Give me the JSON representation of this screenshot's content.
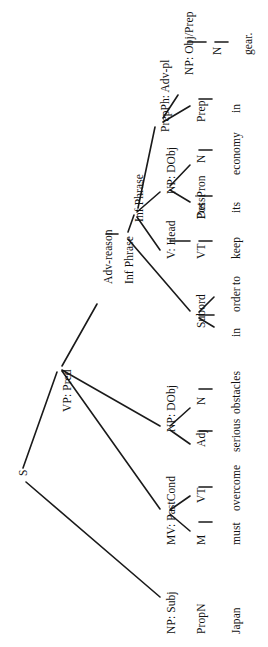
{
  "diagram": {
    "sentence": "Japan must overcome serious obstacles in order to keep its economy in gear.",
    "orientation": "rotated-90-ccw",
    "root": "S",
    "nodes": [
      {
        "id": "s",
        "label": "S",
        "kind": "node",
        "x": 18,
        "y": 476
      },
      {
        "id": "np_subj",
        "label": "NP: Subj",
        "kind": "node",
        "x": 166,
        "y": 634
      },
      {
        "id": "propn",
        "label": "PropN",
        "kind": "node",
        "x": 196,
        "y": 634
      },
      {
        "id": "japan",
        "label": "Japan",
        "kind": "leaf",
        "x": 231,
        "y": 634
      },
      {
        "id": "vp_pred",
        "label": "VP: Pred",
        "kind": "node",
        "x": 62,
        "y": 412
      },
      {
        "id": "mv_pastcond",
        "label": "MV: PastCond",
        "kind": "node",
        "x": 166,
        "y": 545
      },
      {
        "id": "m",
        "label": "M",
        "kind": "node",
        "x": 196,
        "y": 545
      },
      {
        "id": "must",
        "label": "must",
        "kind": "leaf",
        "x": 231,
        "y": 545
      },
      {
        "id": "vt1",
        "label": "VT",
        "kind": "node",
        "x": 196,
        "y": 503
      },
      {
        "id": "overcome",
        "label": "overcome",
        "kind": "leaf",
        "x": 231,
        "y": 511
      },
      {
        "id": "np_dobj1",
        "label": "NP: DObj",
        "kind": "node",
        "x": 166,
        "y": 432
      },
      {
        "id": "adj",
        "label": "Adj",
        "kind": "node",
        "x": 196,
        "y": 447
      },
      {
        "id": "serious",
        "label": "serious",
        "kind": "leaf",
        "x": 231,
        "y": 452
      },
      {
        "id": "n1",
        "label": "N",
        "kind": "node",
        "x": 196,
        "y": 405
      },
      {
        "id": "obstacles",
        "label": "obstacles",
        "kind": "leaf",
        "x": 231,
        "y": 414
      },
      {
        "id": "adv_reason",
        "label": "Adv-reason",
        "kind": "node",
        "x": 103,
        "y": 284
      },
      {
        "id": "inf_phrase1",
        "label": "Inf Phrase",
        "kind": "node",
        "x": 124,
        "y": 284
      },
      {
        "id": "subord",
        "label": "Subord",
        "kind": "node",
        "x": 196,
        "y": 328
      },
      {
        "id": "in1",
        "label": "in",
        "kind": "leaf",
        "x": 231,
        "y": 337
      },
      {
        "id": "order",
        "label": "order",
        "kind": "leaf",
        "x": 231,
        "y": 312
      },
      {
        "id": "to",
        "label": "to",
        "kind": "leaf",
        "x": 231,
        "y": 285
      },
      {
        "id": "inf_phrase2",
        "label": "Inf Phrase",
        "kind": "node",
        "x": 134,
        "y": 222
      },
      {
        "id": "v_head",
        "label": "V: Head",
        "kind": "node",
        "x": 166,
        "y": 259
      },
      {
        "id": "vt2",
        "label": "VT",
        "kind": "node",
        "x": 196,
        "y": 259
      },
      {
        "id": "keep",
        "label": "keep",
        "kind": "leaf",
        "x": 231,
        "y": 259
      },
      {
        "id": "np_dobj2",
        "label": "NP: DObj",
        "kind": "node",
        "x": 166,
        "y": 194
      },
      {
        "id": "det",
        "label": "Det",
        "kind": "node",
        "x": 196,
        "y": 219
      },
      {
        "id": "posspron",
        "label": "PossPron",
        "kind": "node",
        "x": 196,
        "y": 219
      },
      {
        "id": "its",
        "label": "its",
        "kind": "leaf",
        "x": 231,
        "y": 213
      },
      {
        "id": "n2",
        "label": "N",
        "kind": "node",
        "x": 196,
        "y": 163
      },
      {
        "id": "economy",
        "label": "economy",
        "kind": "leaf",
        "x": 231,
        "y": 175
      },
      {
        "id": "prepph",
        "label": "PrepPh: Adv-pl",
        "kind": "node",
        "x": 160,
        "y": 132
      },
      {
        "id": "prep",
        "label": "Prep",
        "kind": "node",
        "x": 196,
        "y": 122
      },
      {
        "id": "in2",
        "label": "in",
        "kind": "leaf",
        "x": 231,
        "y": 113
      },
      {
        "id": "np_objprep",
        "label": "NP: Obj/Prep",
        "kind": "node",
        "x": 184,
        "y": 75
      },
      {
        "id": "n3",
        "label": "N",
        "kind": "node",
        "x": 212,
        "y": 55
      },
      {
        "id": "gear",
        "label": "gear.",
        "kind": "leaf",
        "x": 243,
        "y": 55
      }
    ],
    "edges": [
      {
        "from": "s",
        "to": "np_subj",
        "x1": 26,
        "y1": 482,
        "x2": 160,
        "y2": 597
      },
      {
        "from": "s",
        "to": "vp_pred",
        "x1": 23,
        "y1": 468,
        "x2": 57,
        "y2": 372
      },
      {
        "from": "vp_pred",
        "to": "mv_pastcond",
        "x1": 62,
        "y1": 371,
        "x2": 160,
        "y2": 509
      },
      {
        "from": "vp_pred",
        "to": "np_dobj1",
        "x1": 62,
        "y1": 370,
        "x2": 160,
        "y2": 426
      },
      {
        "from": "vp_pred",
        "to": "adv_reason",
        "x1": 62,
        "y1": 366,
        "x2": 97,
        "y2": 304
      },
      {
        "from": "mv_pastcond",
        "to": "m",
        "x1": 170,
        "y1": 514,
        "x2": 190,
        "y2": 531
      },
      {
        "from": "mv_pastcond",
        "to": "vt1",
        "x1": 170,
        "y1": 510,
        "x2": 190,
        "y2": 496
      },
      {
        "from": "m",
        "to": "must",
        "x1": 199,
        "y1": 522,
        "x2": 212,
        "y2": 522
      },
      {
        "from": "vt1",
        "to": "overcome",
        "x1": 199,
        "y1": 487,
        "x2": 212,
        "y2": 487
      },
      {
        "from": "np_dobj1",
        "to": "adj",
        "x1": 170,
        "y1": 430,
        "x2": 190,
        "y2": 444
      },
      {
        "from": "np_dobj1",
        "to": "n1",
        "x1": 170,
        "y1": 426,
        "x2": 190,
        "y2": 408
      },
      {
        "from": "adj",
        "to": "serious",
        "x1": 199,
        "y1": 431,
        "x2": 212,
        "y2": 431
      },
      {
        "from": "n1",
        "to": "obstacles",
        "x1": 199,
        "y1": 389,
        "x2": 212,
        "y2": 389
      },
      {
        "from": "adv_reason",
        "to": "inf_phrase1",
        "x1": 106,
        "y1": 234,
        "x2": 118,
        "y2": 234
      },
      {
        "from": "inf_phrase1",
        "to": "subord",
        "x1": 128,
        "y1": 239,
        "x2": 190,
        "y2": 311
      },
      {
        "from": "inf_phrase1",
        "to": "inf_phrase2",
        "x1": 128,
        "y1": 232,
        "x2": 134,
        "y2": 215
      },
      {
        "from": "subord",
        "to": "in1",
        "x1": 199,
        "y1": 318,
        "x2": 214,
        "y2": 327
      },
      {
        "from": "subord",
        "to": "order",
        "x1": 199,
        "y1": 315,
        "x2": 214,
        "y2": 315
      },
      {
        "from": "subord",
        "to": "to",
        "x1": 199,
        "y1": 312,
        "x2": 214,
        "y2": 297
      },
      {
        "from": "inf_phrase2",
        "to": "v_head",
        "x1": 137,
        "y1": 217,
        "x2": 160,
        "y2": 250
      },
      {
        "from": "inf_phrase2",
        "to": "np_dobj2",
        "x1": 137,
        "y1": 212,
        "x2": 160,
        "y2": 192
      },
      {
        "from": "inf_phrase2",
        "to": "prepph",
        "x1": 138,
        "y1": 208,
        "x2": 155,
        "y2": 127
      },
      {
        "from": "v_head",
        "to": "vt2",
        "x1": 170,
        "y1": 241,
        "x2": 190,
        "y2": 241
      },
      {
        "from": "vt2",
        "to": "keep",
        "x1": 199,
        "y1": 241,
        "x2": 212,
        "y2": 241
      },
      {
        "from": "np_dobj2",
        "to": "det",
        "x1": 170,
        "y1": 190,
        "x2": 190,
        "y2": 202
      },
      {
        "from": "np_dobj2",
        "to": "n2",
        "x1": 170,
        "y1": 186,
        "x2": 190,
        "y2": 165
      },
      {
        "from": "det",
        "to": "posspron",
        "x1": 196,
        "y1": 196,
        "x2": 196,
        "y2": 196
      },
      {
        "from": "posspron",
        "to": "its",
        "x1": 199,
        "y1": 196,
        "x2": 212,
        "y2": 196
      },
      {
        "from": "n2",
        "to": "economy",
        "x1": 199,
        "y1": 150,
        "x2": 212,
        "y2": 150
      },
      {
        "from": "prepph",
        "to": "prep",
        "x1": 163,
        "y1": 122,
        "x2": 190,
        "y2": 106
      },
      {
        "from": "prepph",
        "to": "np_objprep",
        "x1": 163,
        "y1": 118,
        "x2": 178,
        "y2": 95
      },
      {
        "from": "prep",
        "to": "in2",
        "x1": 199,
        "y1": 99,
        "x2": 212,
        "y2": 99
      },
      {
        "from": "np_objprep",
        "to": "n3",
        "x1": 188,
        "y1": 42,
        "x2": 206,
        "y2": 42
      },
      {
        "from": "n3",
        "to": "gear",
        "x1": 215,
        "y1": 42,
        "x2": 228,
        "y2": 42
      }
    ],
    "leaf_words": [
      "Japan",
      "must",
      "overcome",
      "serious",
      "obstacles",
      "in",
      "order",
      "to",
      "keep",
      "its",
      "economy",
      "in",
      "gear."
    ],
    "colors": {
      "line": "#1a1a1a",
      "text": "#111111",
      "background": "#ffffff"
    }
  }
}
